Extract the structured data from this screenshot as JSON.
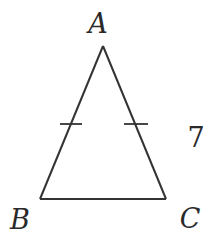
{
  "diagram": {
    "type": "isosceles-triangle",
    "vertices": [
      {
        "name": "A",
        "x": 103,
        "y": 46,
        "label_x": 98,
        "label_y": 33
      },
      {
        "name": "B",
        "x": 40,
        "y": 199,
        "label_x": 20,
        "label_y": 229
      },
      {
        "name": "C",
        "x": 166,
        "y": 199,
        "label_x": 190,
        "label_y": 228
      }
    ],
    "edges": [
      {
        "from": "A",
        "to": "B"
      },
      {
        "from": "A",
        "to": "C"
      },
      {
        "from": "B",
        "to": "C"
      }
    ],
    "tick_marks": [
      {
        "side": "AB",
        "x1": 60,
        "y1": 124,
        "x2": 82,
        "y2": 124
      },
      {
        "side": "AC",
        "x1": 124,
        "y1": 124,
        "x2": 148,
        "y2": 124
      }
    ],
    "side_labels": [
      {
        "side": "AC",
        "text": "7",
        "x": 196,
        "y": 147
      }
    ],
    "colors": {
      "line": "#333333",
      "text": "#2a2a2a",
      "background": "#ffffff"
    }
  }
}
